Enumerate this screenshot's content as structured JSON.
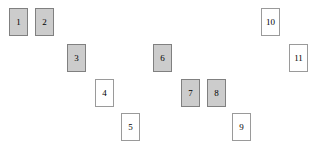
{
  "scene": {
    "background_color": "#ffffff",
    "width": 320,
    "height": 152,
    "card_count": 11,
    "filled_color": "#cccccc",
    "filled_border_color": "#808080",
    "empty_color": "#ffffff",
    "empty_border_color": "#9a9a9a"
  },
  "cards": [
    {
      "label": "1",
      "x": 9,
      "y": 8,
      "w": 19,
      "h": 28,
      "style": "filled"
    },
    {
      "label": "2",
      "x": 35,
      "y": 8,
      "w": 19,
      "h": 28,
      "style": "filled"
    },
    {
      "label": "3",
      "x": 67,
      "y": 44,
      "w": 19,
      "h": 28,
      "style": "filled"
    },
    {
      "label": "4",
      "x": 95,
      "y": 79,
      "w": 19,
      "h": 28,
      "style": "empty"
    },
    {
      "label": "5",
      "x": 121,
      "y": 113,
      "w": 19,
      "h": 28,
      "style": "empty"
    },
    {
      "label": "6",
      "x": 153,
      "y": 44,
      "w": 19,
      "h": 28,
      "style": "filled"
    },
    {
      "label": "7",
      "x": 181,
      "y": 79,
      "w": 19,
      "h": 28,
      "style": "filled"
    },
    {
      "label": "8",
      "x": 207,
      "y": 79,
      "w": 19,
      "h": 28,
      "style": "filled"
    },
    {
      "label": "9",
      "x": 232,
      "y": 113,
      "w": 19,
      "h": 28,
      "style": "empty"
    },
    {
      "label": "10",
      "x": 261,
      "y": 8,
      "w": 19,
      "h": 28,
      "style": "empty"
    },
    {
      "label": "11",
      "x": 289,
      "y": 44,
      "w": 19,
      "h": 28,
      "style": "empty"
    }
  ]
}
